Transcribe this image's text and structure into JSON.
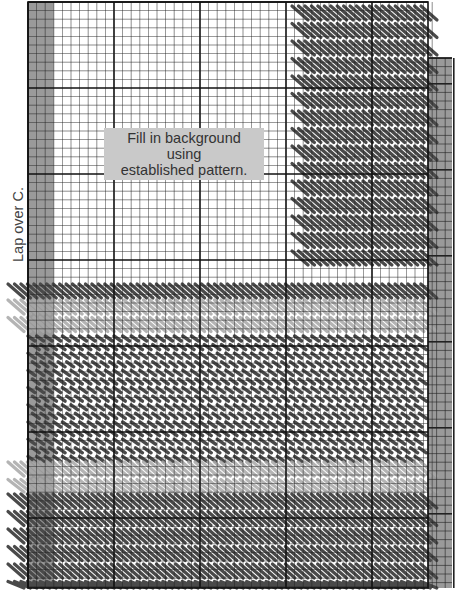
{
  "diagram": {
    "type": "needlepoint-stitch-chart",
    "instruction_label": {
      "line1": "Fill in background using",
      "line2": "established pattern."
    },
    "side_label": "Lap over C.",
    "right_edge_label": "",
    "colors": {
      "grid_line": "#222222",
      "major_grid_line": "#111111",
      "margin_gray": "#9a9a9a",
      "dark_stitch": "#4a4a4a",
      "light_stitch": "#a8a8a8",
      "label_bg": "#c9c9c9",
      "label_text": "#333333"
    },
    "grid": {
      "left": 28,
      "top": 2,
      "right": 428,
      "bottom": 588,
      "cell": 8.6,
      "major_every": 10,
      "left_margin_cells": 3,
      "right_strip": {
        "left": 428,
        "right": 452,
        "top": 58,
        "bottom": 588
      }
    },
    "bands": [
      {
        "name": "upper-right-diagonals",
        "x0": 292,
        "x1": 422,
        "y0": 6,
        "y1": 272,
        "style": "long",
        "shade": "dark"
      },
      {
        "name": "top-long-row",
        "x0": 8,
        "x1": 422,
        "y0": 284,
        "y1": 300,
        "style": "long",
        "shade": "dark"
      },
      {
        "name": "light-band-1",
        "x0": 8,
        "x1": 422,
        "y0": 300,
        "y1": 335,
        "style": "long",
        "shade": "light"
      },
      {
        "name": "middle-short-field",
        "x0": 28,
        "x1": 422,
        "y0": 335,
        "y1": 462,
        "style": "short",
        "shade": "dark"
      },
      {
        "name": "light-band-2",
        "x0": 8,
        "x1": 422,
        "y0": 462,
        "y1": 492,
        "style": "long",
        "shade": "light"
      },
      {
        "name": "bottom-long-field",
        "x0": 8,
        "x1": 422,
        "y0": 494,
        "y1": 588,
        "style": "long",
        "shade": "dark"
      }
    ]
  }
}
